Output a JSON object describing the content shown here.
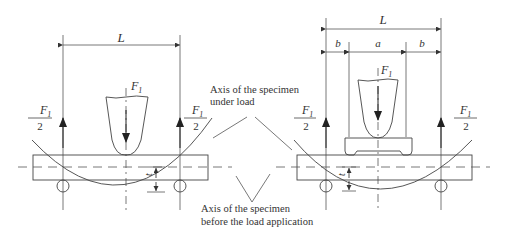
{
  "figure": {
    "left_diagram": {
      "name": "three-point bending",
      "span_label": "L",
      "applied_force_label": "F",
      "applied_force_subscript": "1",
      "reaction_left": {
        "numerator": "F",
        "subscript": "1",
        "denominator": "2"
      },
      "reaction_right": {
        "numerator": "F",
        "subscript": "1",
        "denominator": "2"
      },
      "deflection_label": "t"
    },
    "right_diagram": {
      "name": "four-point bending",
      "span_label": "L",
      "segment_labels": [
        "b",
        "a",
        "b"
      ],
      "applied_force_label": "F",
      "applied_force_subscript": "1",
      "reaction_left": {
        "numerator": "F",
        "subscript": "1",
        "denominator": "2"
      },
      "reaction_right": {
        "numerator": "F",
        "subscript": "1",
        "denominator": "2"
      },
      "deflection_label": "t"
    },
    "annotations": {
      "under_load_line1": "Axis of the specimen",
      "under_load_line2": "under load",
      "before_load_line1": "Axis of the specimen",
      "before_load_line2": "before the load application"
    },
    "colors": {
      "line": "#444444",
      "text": "#333333",
      "background": "#ffffff"
    }
  }
}
